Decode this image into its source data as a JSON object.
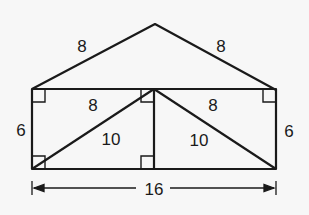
{
  "figure": {
    "roof_left": "8",
    "roof_right": "8",
    "top_left_segment": "8",
    "top_right_segment": "8",
    "left_side": "6",
    "right_side": "6",
    "left_diagonal": "10",
    "right_diagonal": "10",
    "total_width": "16"
  },
  "colors": {
    "stroke": "#1a1a1a",
    "background": "#f7f7f7"
  }
}
